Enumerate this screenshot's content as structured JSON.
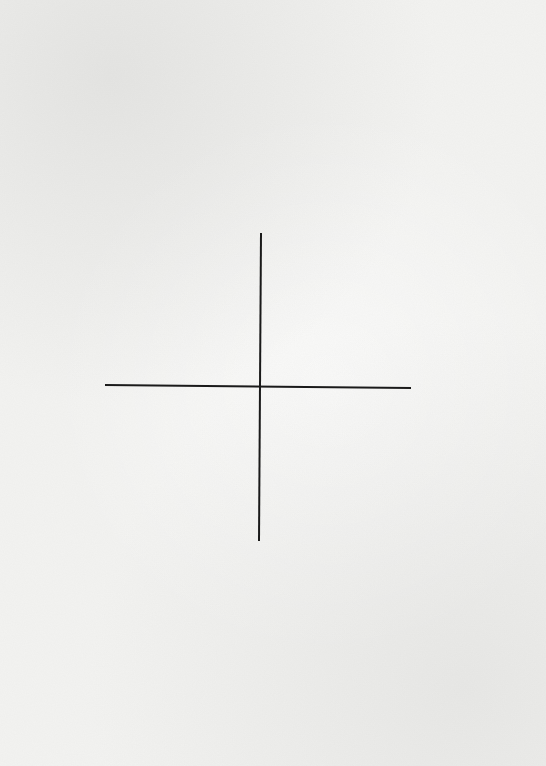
{
  "canvas": {
    "width": 546,
    "height": 766,
    "background_color": "#f3f3f1",
    "stroke_color": "#1a1a1a",
    "stroke_width": 2
  },
  "diagram": {
    "type": "axis-cross",
    "intersection": {
      "x": 260,
      "y": 386
    },
    "lines": [
      {
        "name": "vertical-axis",
        "x1": 261,
        "y1": 233,
        "x2": 259,
        "y2": 541
      },
      {
        "name": "horizontal-axis",
        "x1": 105,
        "y1": 385,
        "x2": 411,
        "y2": 388
      }
    ]
  }
}
